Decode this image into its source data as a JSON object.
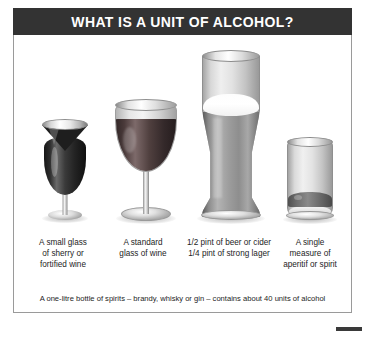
{
  "header": {
    "title": "WHAT IS A UNIT OF ALCOHOL?",
    "background_color": "#333333",
    "text_color": "#ffffff"
  },
  "panel": {
    "background_color": "#ffffff",
    "border_color": "#9a9a9a"
  },
  "items": [
    {
      "id": "sherry",
      "icon_name": "sherry-glass-illustration",
      "caption_lines": [
        "A small glass",
        "of sherry or",
        "fortified wine"
      ]
    },
    {
      "id": "wine",
      "icon_name": "wine-glass-illustration",
      "caption_lines": [
        "A standard",
        "glass of wine"
      ]
    },
    {
      "id": "beer",
      "icon_name": "pint-glass-illustration",
      "caption_lines": [
        "1/2 pint of beer or cider",
        "1/4 pint of strong lager"
      ]
    },
    {
      "id": "spirit",
      "icon_name": "tumbler-glass-illustration",
      "caption_lines": [
        "A single",
        "measure of",
        "aperitif or spirit"
      ]
    }
  ],
  "footnote": {
    "text": "A one-litre bottle of spirits – brandy, whisky or gin – contains about 40 units of alcohol"
  }
}
